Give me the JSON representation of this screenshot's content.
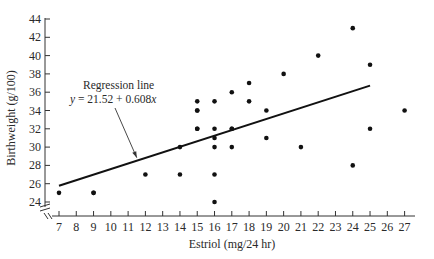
{
  "chart_data": {
    "type": "scatter",
    "title": "",
    "xlabel": "Estriol (mg/24 hr)",
    "ylabel": "Birthweight (g/100)",
    "xlim": [
      7,
      27
    ],
    "ylim": [
      24,
      44
    ],
    "x_ticks": [
      7,
      8,
      9,
      10,
      11,
      12,
      13,
      14,
      15,
      16,
      17,
      18,
      19,
      20,
      21,
      22,
      23,
      24,
      25,
      26,
      27
    ],
    "y_ticks": [
      24,
      26,
      28,
      30,
      32,
      34,
      36,
      38,
      40,
      42,
      44
    ],
    "grid": false,
    "axis_break_marks": true,
    "series": [
      {
        "name": "Observations",
        "points": [
          [
            7,
            25
          ],
          [
            9,
            25
          ],
          [
            9,
            25
          ],
          [
            12,
            27
          ],
          [
            14,
            27
          ],
          [
            16,
            27
          ],
          [
            16,
            24
          ],
          [
            14,
            30
          ],
          [
            16,
            30
          ],
          [
            16,
            31
          ],
          [
            17,
            30
          ],
          [
            19,
            31
          ],
          [
            21,
            30
          ],
          [
            24,
            28
          ],
          [
            15,
            32
          ],
          [
            15,
            32
          ],
          [
            16,
            32
          ],
          [
            17,
            32
          ],
          [
            17,
            32
          ],
          [
            25,
            32
          ],
          [
            15,
            34
          ],
          [
            15,
            34
          ],
          [
            15,
            35
          ],
          [
            16,
            35
          ],
          [
            18,
            35
          ],
          [
            19,
            34
          ],
          [
            27,
            34
          ],
          [
            17,
            36
          ],
          [
            18,
            37
          ],
          [
            20,
            38
          ],
          [
            22,
            40
          ],
          [
            25,
            39
          ],
          [
            24,
            43
          ]
        ]
      }
    ],
    "regression": {
      "label": "Regression line",
      "equation": "y = 21.52 + 0.608x",
      "intercept": 21.52,
      "slope": 0.608,
      "x_range": [
        7,
        25
      ]
    },
    "annotation": {
      "line1": "Regression line",
      "line2": "y = 21.52 + 0.608x",
      "arrow_target_x": 11.5
    }
  }
}
